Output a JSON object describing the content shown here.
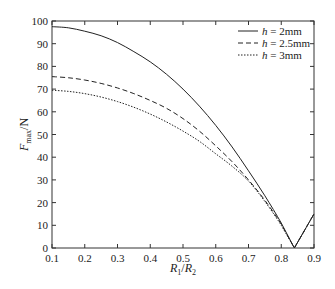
{
  "chart_data": {
    "type": "line",
    "title": "",
    "xlabel": "R1/R2",
    "ylabel": "Fmax/N",
    "xlim": [
      0.1,
      0.9
    ],
    "ylim": [
      0,
      100
    ],
    "xticks": [
      0.1,
      0.2,
      0.3,
      0.4,
      0.5,
      0.6,
      0.7,
      0.8,
      0.9
    ],
    "yticks": [
      0,
      10,
      20,
      30,
      40,
      50,
      60,
      70,
      80,
      90,
      100
    ],
    "grid": false,
    "legend_position": "upper right",
    "x": [
      0.1,
      0.15,
      0.2,
      0.25,
      0.3,
      0.35,
      0.4,
      0.45,
      0.5,
      0.55,
      0.6,
      0.65,
      0.7,
      0.75,
      0.8,
      0.84,
      0.9
    ],
    "series": [
      {
        "name": "h = 2mm",
        "style": "solid",
        "values": [
          97.5,
          97,
          95.5,
          93.5,
          90.5,
          86.5,
          82,
          76.5,
          70,
          62.5,
          54,
          44.5,
          34,
          23,
          11,
          0,
          15
        ]
      },
      {
        "name": "h = 2.5mm",
        "style": "dashed",
        "values": [
          75.5,
          75,
          74,
          72.5,
          70.5,
          68,
          65,
          61.5,
          57,
          51.5,
          45,
          38,
          30,
          21,
          10.5,
          0,
          15
        ]
      },
      {
        "name": "h = 3mm",
        "style": "dotted",
        "values": [
          69.5,
          69,
          68,
          66.5,
          64.5,
          62,
          59,
          55.5,
          51.5,
          47,
          41.5,
          36,
          29.5,
          20.5,
          10,
          0,
          15
        ]
      }
    ]
  },
  "axes": {
    "xlabel_main": "R",
    "xlabel_sub1": "1",
    "xlabel_sep": "/",
    "xlabel_sub2": "2",
    "ylabel_main": "F",
    "ylabel_sub": "max",
    "ylabel_unit": "/N"
  },
  "legend": [
    {
      "var": "h",
      "text": " = 2mm"
    },
    {
      "var": "h",
      "text": " = 2.5mm"
    },
    {
      "var": "h",
      "text": " = 3mm"
    }
  ]
}
